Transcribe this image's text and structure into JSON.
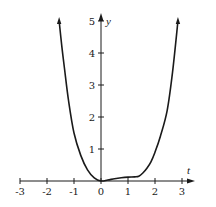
{
  "chart_data": {
    "type": "line",
    "title": "",
    "xlabel": "t",
    "ylabel": "y",
    "xlim": [
      -3,
      3
    ],
    "ylim": [
      0,
      5
    ],
    "grid": false,
    "legend": null,
    "x_ticks": [
      -3,
      -2,
      -1,
      0,
      1,
      2,
      3
    ],
    "x_tick_labels": [
      "-3",
      "-2",
      "-1",
      "0",
      "1",
      "2",
      "3"
    ],
    "y_ticks": [
      1,
      2,
      3,
      4,
      5
    ],
    "y_tick_labels": [
      "1",
      "2",
      "3",
      "4",
      "5"
    ],
    "series": [
      {
        "name": "y(t)",
        "color": "#1a1a1a",
        "arrows_at_ends": true,
        "x": [
          -1.55,
          -1.45,
          -1.35,
          -1.2,
          -1.0,
          -0.75,
          -0.5,
          -0.25,
          0.0,
          0.25,
          0.5,
          0.75,
          1.0,
          1.25,
          1.4,
          1.55,
          1.7,
          1.85,
          2.0,
          2.2,
          2.45,
          2.65,
          2.85
        ],
        "y": [
          5.0,
          4.2,
          3.5,
          2.5,
          1.5,
          0.8,
          0.35,
          0.1,
          0.0,
          0.03,
          0.07,
          0.1,
          0.12,
          0.13,
          0.15,
          0.25,
          0.4,
          0.6,
          0.9,
          1.4,
          2.2,
          3.4,
          5.0
        ]
      }
    ]
  },
  "axes": {
    "x_label": "t",
    "y_label": "y"
  }
}
